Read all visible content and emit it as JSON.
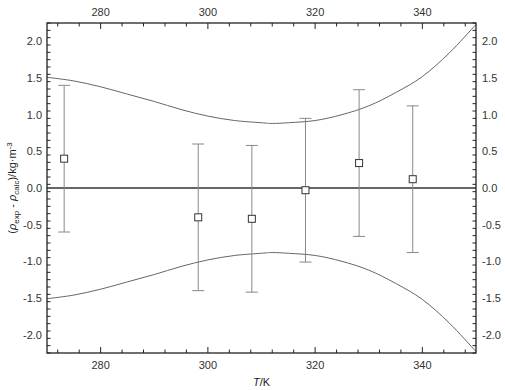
{
  "chart_data": {
    "type": "scatter",
    "title": "",
    "xlabel": "T/K",
    "xlabel_italic_part": "T",
    "xlabel_rest": "/K",
    "ylabel": "(ρexp - ρcalc)/kg·m-3",
    "ylabel_parts": {
      "open": "(",
      "rho1": "ρ",
      "sub1": "exp",
      "minus": " - ",
      "rho2": "ρ",
      "sub2": "calc",
      "close": ")/kg·m",
      "sup": "-3"
    },
    "xlim": [
      270,
      350
    ],
    "ylim": [
      -2.25,
      2.25
    ],
    "x_major_ticks": [
      280,
      300,
      320,
      340
    ],
    "x_tick_labels": [
      "280",
      "300",
      "320",
      "340"
    ],
    "x_minor_step": 4,
    "y_major_ticks": [
      -2.0,
      -1.5,
      -1.0,
      -0.5,
      0.0,
      0.5,
      1.0,
      1.5,
      2.0
    ],
    "y_tick_labels": [
      "-2.0",
      "-1.5",
      "-1.0",
      "-0.5",
      "0.0",
      "0.5",
      "1.0",
      "1.5",
      "2.0"
    ],
    "y_minor_step": 0.1,
    "mirror_axes": true,
    "grid": false,
    "zero_line": 0.0,
    "series": [
      {
        "name": "deviations",
        "marker": "open-square",
        "x": [
          273.2,
          298.2,
          308.2,
          318.2,
          328.2,
          338.2
        ],
        "y": [
          0.4,
          -0.4,
          -0.42,
          -0.03,
          0.34,
          0.12
        ],
        "yerr": [
          1.0,
          1.0,
          1.0,
          0.98,
          1.0,
          1.0
        ]
      },
      {
        "name": "upper uncertainty band",
        "style": "line",
        "x": [
          270,
          275,
          280,
          285,
          290,
          295,
          300,
          305,
          310,
          312,
          315,
          320,
          325,
          330,
          335,
          340,
          345,
          350
        ],
        "y": [
          1.51,
          1.46,
          1.38,
          1.28,
          1.18,
          1.07,
          0.98,
          0.92,
          0.89,
          0.88,
          0.89,
          0.92,
          1.0,
          1.12,
          1.3,
          1.52,
          1.84,
          2.23
        ]
      },
      {
        "name": "lower uncertainty band",
        "style": "line",
        "x": [
          270,
          275,
          280,
          285,
          290,
          295,
          300,
          305,
          310,
          312,
          315,
          320,
          325,
          330,
          335,
          340,
          345,
          350
        ],
        "y": [
          -1.51,
          -1.46,
          -1.38,
          -1.28,
          -1.18,
          -1.07,
          -0.98,
          -0.92,
          -0.89,
          -0.88,
          -0.89,
          -0.92,
          -1.0,
          -1.12,
          -1.3,
          -1.52,
          -1.84,
          -2.23
        ]
      }
    ],
    "colors": {
      "axis": "#222222",
      "zero_line": "#333333",
      "curve": "#666666",
      "errorbar": "#888888",
      "marker_stroke": "#333333",
      "marker_fill": "#ffffff"
    }
  }
}
